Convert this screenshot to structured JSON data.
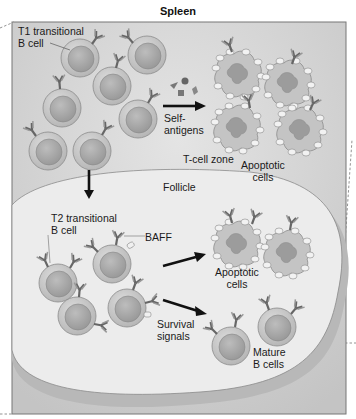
{
  "title": "Spleen",
  "labels": {
    "t1": "T1 transitional\nB cell",
    "self_antigens": "Self-\nantigens",
    "tcell_zone": "T-cell zone",
    "apoptotic_top": "Apoptotic\ncells",
    "follicle": "Follicle",
    "t2": "T2 transitional\nB cell",
    "baff": "BAFF",
    "apoptotic_bottom": "Apoptotic\ncells",
    "survival": "Survival\nsignals",
    "mature": "Mature\nB cells"
  },
  "colors": {
    "background_zone": "#d2d2d2",
    "follicle": "#e9e9e9",
    "cell_outer": "#c9c9c9",
    "cell_inner": "#a9a9a9",
    "arrow": "#111111",
    "border": "#777777"
  }
}
